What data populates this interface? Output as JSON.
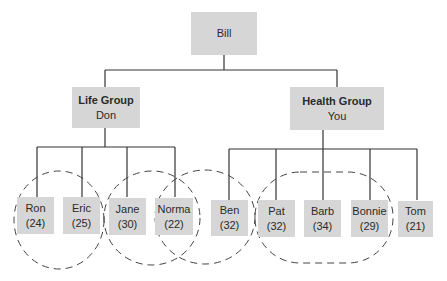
{
  "diagram": {
    "type": "org-chart",
    "root": {
      "label": "Bill"
    },
    "groups": [
      {
        "title": "Life Group",
        "leader": "Don"
      },
      {
        "title": "Health Group",
        "leader": "You"
      }
    ],
    "members": [
      {
        "name": "Ron",
        "age": "(24)",
        "group": "Life Group"
      },
      {
        "name": "Eric",
        "age": "(25)",
        "group": "Life Group"
      },
      {
        "name": "Jane",
        "age": "(30)",
        "group": "Life Group"
      },
      {
        "name": "Norma",
        "age": "(22)",
        "group": "Life Group"
      },
      {
        "name": "Ben",
        "age": "(32)",
        "group": "Health Group"
      },
      {
        "name": "Pat",
        "age": "(32)",
        "group": "Health Group"
      },
      {
        "name": "Barb",
        "age": "(34)",
        "group": "Health Group"
      },
      {
        "name": "Bonnie",
        "age": "(29)",
        "group": "Health Group"
      },
      {
        "name": "Tom",
        "age": "(21)",
        "group": "Health Group"
      }
    ],
    "clusters": [
      {
        "members": [
          "Ron",
          "Eric"
        ],
        "style": "dashed-circle"
      },
      {
        "members": [
          "Jane",
          "Norma"
        ],
        "style": "dashed-circle"
      },
      {
        "members": [
          "Norma",
          "Ben"
        ],
        "style": "dashed-circle"
      },
      {
        "members": [
          "Pat",
          "Barb",
          "Bonnie"
        ],
        "style": "dashed-ellipse"
      }
    ],
    "colors": {
      "box_fill": "#d6d6d6",
      "line": "#333333",
      "text": "#2a2a2a"
    }
  }
}
